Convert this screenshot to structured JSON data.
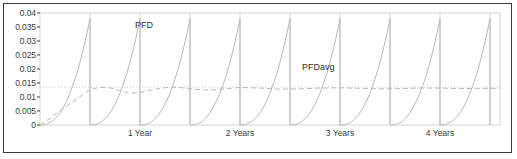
{
  "chart_data": {
    "type": "line",
    "title": "",
    "xlabel": "",
    "ylabel": "",
    "ylim": [
      0,
      0.04
    ],
    "xlim": [
      0,
      4.6
    ],
    "grid": true,
    "legend_position": "inline-annotation",
    "y_ticks": [
      "0",
      "0.005",
      "0.01",
      "0.015",
      "0.02",
      "0.025",
      "0.03",
      "0.035",
      "0.04"
    ],
    "y_tick_values": [
      0,
      0.005,
      0.01,
      0.015,
      0.02,
      0.025,
      0.03,
      0.035,
      0.04
    ],
    "x_ticks": [
      "1 Year",
      "2 Years",
      "3 Years",
      "4 Years"
    ],
    "x_tick_values": [
      1,
      2,
      3,
      4
    ],
    "annotations": [
      {
        "text": "PFD",
        "x": 0.95,
        "y": 0.0355
      },
      {
        "text": "PFDavg",
        "x": 2.62,
        "y": 0.0205
      }
    ],
    "series": [
      {
        "name": "PFD",
        "style": "solid-sawtooth",
        "color": "#b8b8b8",
        "description": "Probability of failure on demand; exponential rise reset by proof test every 0.5 year",
        "peak_value": 0.038,
        "reset_value": 0.0,
        "period_years": 0.5,
        "cycles": 9
      },
      {
        "name": "PFDavg",
        "style": "dashed",
        "color": "#b8b8b8",
        "description": "Running average probability of failure on demand converging to steady state",
        "steady_value": 0.013,
        "points": [
          {
            "x": 0.0,
            "y": 0.0
          },
          {
            "x": 0.1,
            "y": 0.0024
          },
          {
            "x": 0.2,
            "y": 0.005
          },
          {
            "x": 0.3,
            "y": 0.0076
          },
          {
            "x": 0.4,
            "y": 0.0101
          },
          {
            "x": 0.5,
            "y": 0.0126
          },
          {
            "x": 0.6,
            "y": 0.0135
          },
          {
            "x": 0.7,
            "y": 0.0133
          },
          {
            "x": 0.8,
            "y": 0.0122
          },
          {
            "x": 0.9,
            "y": 0.0114
          },
          {
            "x": 1.0,
            "y": 0.0116
          },
          {
            "x": 1.1,
            "y": 0.0124
          },
          {
            "x": 1.2,
            "y": 0.0131
          },
          {
            "x": 1.3,
            "y": 0.0135
          },
          {
            "x": 1.4,
            "y": 0.0134
          },
          {
            "x": 1.5,
            "y": 0.013
          },
          {
            "x": 1.6,
            "y": 0.0126
          },
          {
            "x": 1.7,
            "y": 0.0125
          },
          {
            "x": 1.8,
            "y": 0.0127
          },
          {
            "x": 1.9,
            "y": 0.0131
          },
          {
            "x": 2.0,
            "y": 0.0134
          },
          {
            "x": 2.2,
            "y": 0.0132
          },
          {
            "x": 2.4,
            "y": 0.0128
          },
          {
            "x": 2.6,
            "y": 0.0129
          },
          {
            "x": 2.8,
            "y": 0.0132
          },
          {
            "x": 3.0,
            "y": 0.0133
          },
          {
            "x": 3.2,
            "y": 0.0131
          },
          {
            "x": 3.4,
            "y": 0.0129
          },
          {
            "x": 3.6,
            "y": 0.013
          },
          {
            "x": 3.8,
            "y": 0.0132
          },
          {
            "x": 4.0,
            "y": 0.0132
          },
          {
            "x": 4.2,
            "y": 0.013
          },
          {
            "x": 4.4,
            "y": 0.0131
          },
          {
            "x": 4.6,
            "y": 0.0131
          }
        ]
      },
      {
        "name": "target-line",
        "style": "dotted-horizontal",
        "color": "#cfcfcf",
        "value": 0.0135
      }
    ],
    "gridlines_x": [
      0.5,
      1.0,
      1.5,
      2.0,
      2.5,
      3.0,
      3.5,
      4.0,
      4.5
    ]
  },
  "colors": {
    "frame_border": "#3a3a3a",
    "plot_border": "#d4d4d4",
    "axis_text": "#3c3c3c",
    "series_line": "#b8b8b8",
    "gridline": "#d4d4d4",
    "background": "#ffffff"
  }
}
